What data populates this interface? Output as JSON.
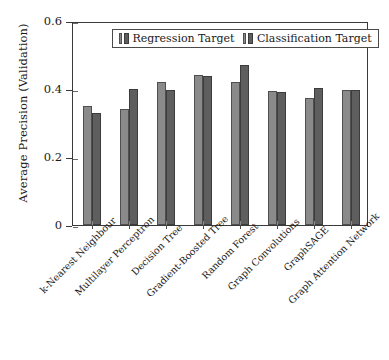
{
  "chart_data": {
    "type": "bar",
    "title": "",
    "xlabel": "",
    "ylabel": "Average Precision (Validation)",
    "ylim": [
      0,
      0.6
    ],
    "yticks": [
      "0",
      "0.2",
      "0.4",
      "0.6"
    ],
    "ytick_values": [
      0,
      0.2,
      0.4,
      0.6
    ],
    "grid": false,
    "legend_position": "upper center",
    "categories": [
      "k-Nearest Neighbour",
      "Multilayer Perceptron",
      "Decision Tree",
      "Gradient-Boosted Tree",
      "Random Forest",
      "Graph Convolutions",
      "GraphSAGE",
      "Graph Attention Network"
    ],
    "series": [
      {
        "name": "Regression Target",
        "color": "#8a8a8a",
        "values": [
          0.35,
          0.34,
          0.42,
          0.44,
          0.42,
          0.395,
          0.373,
          0.396
        ]
      },
      {
        "name": "Classification Target",
        "color": "#5e5e5e",
        "values": [
          0.33,
          0.399,
          0.396,
          0.438,
          0.47,
          0.39,
          0.402,
          0.396
        ]
      }
    ]
  },
  "legend": {
    "entries": [
      {
        "label": "Regression Target"
      },
      {
        "label": "Classification Target"
      }
    ]
  },
  "axes": {
    "y_title": "Average Precision (Validation)"
  }
}
